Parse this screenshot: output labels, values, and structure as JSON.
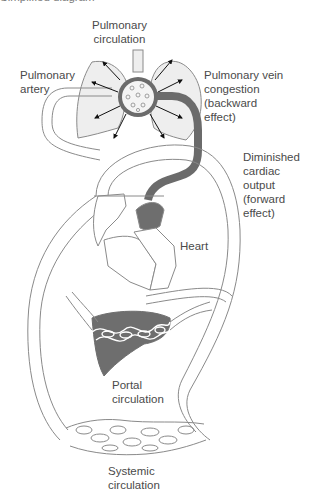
{
  "figure": {
    "cut_title": "Simplified diagram",
    "colors": {
      "outline": "#8a8a8a",
      "vessel_dark": "#6b6b6b",
      "organ_fill": "#6e6e6e",
      "lung_fill": "#eeeeee",
      "text": "#4a4a4a",
      "background": "#ffffff"
    }
  },
  "labels": {
    "pulmonary_circulation": "Pulmonary\ncirculation",
    "pulmonary_artery": "Pulmonary\nartery",
    "pulmonary_vein_congestion": "Pulmonary vein\ncongestion\n(backward\neffect)",
    "diminished_cardiac_output": "Diminished\ncardiac\noutput\n(forward\neffect)",
    "heart": "Heart",
    "portal_circulation": "Portal\ncirculation",
    "systemic_circulation": "Systemic\ncirculation"
  }
}
